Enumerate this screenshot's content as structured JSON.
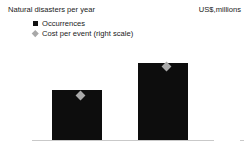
{
  "chart_data": {
    "type": "bar",
    "title": "",
    "categories": [
      "1980-99",
      "2000-21"
    ],
    "series": [
      {
        "name": "Occurrences",
        "type": "bar",
        "axis": "left",
        "color": "#0d0d0d",
        "marker": "square",
        "values": [
          28,
          43
        ]
      },
      {
        "name": "Cost per event (right scale)",
        "type": "scatter",
        "axis": "right",
        "color": "#a9a9a9",
        "marker": "diamond",
        "values": [
          125,
          205
        ]
      }
    ],
    "xlabel": "",
    "ylabel": "Natural disasters per year",
    "y2label": "US$,millions",
    "ylim": [
      0,
      50
    ],
    "y2lim": [
      0,
      250
    ],
    "yticks": [
      "0",
      "10",
      "20",
      "30",
      "40",
      "50"
    ],
    "ytick_values": [
      0,
      10,
      20,
      30,
      40,
      50
    ],
    "y2ticks": [
      "0",
      "50",
      "100",
      "150",
      "200",
      "250"
    ],
    "y2tick_values": [
      0,
      50,
      100,
      150,
      200,
      250
    ],
    "grid": false,
    "legend_position": "top-left"
  },
  "left_axis": {
    "title": "Natural disasters per year",
    "ticks": [
      "50",
      "40",
      "30",
      "20",
      "10",
      "0"
    ]
  },
  "right_axis": {
    "title": "US$,millions",
    "ticks": [
      "250",
      "200",
      "150",
      "100",
      "50",
      "0"
    ]
  },
  "legend": {
    "items": [
      {
        "label": "Occurrences",
        "marker": "square-marker",
        "color": "#111111"
      },
      {
        "label": "Cost per event (right scale)",
        "marker": "diamond-marker",
        "color": "#a8a8a8"
      }
    ]
  },
  "categories": [
    {
      "label": "1980-99"
    },
    {
      "label": "2000-21"
    }
  ]
}
